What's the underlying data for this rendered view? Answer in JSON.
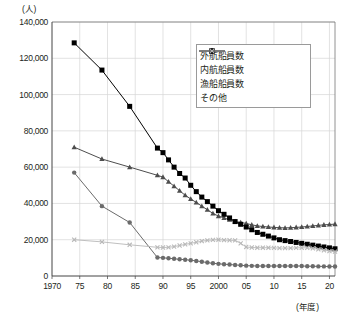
{
  "chart_data": {
    "type": "line",
    "title": "",
    "xlabel": "(年度)",
    "ylabel": "(人)",
    "ylim": [
      0,
      140000
    ],
    "ytick_step": 20000,
    "grid": true,
    "legend_position": "top-right",
    "ytick_labels": [
      "140,000",
      "120,000",
      "100,000",
      "80,000",
      "60,000",
      "40,000",
      "20,000",
      "0"
    ],
    "ytick_values": [
      140000,
      120000,
      100000,
      80000,
      60000,
      40000,
      20000,
      0
    ],
    "xtick_labels": [
      "1970",
      "75",
      "80",
      "85",
      "90",
      "95",
      "2000",
      "05",
      "10",
      "15",
      "20"
    ],
    "xtick_values": [
      1970,
      1975,
      1980,
      1985,
      1990,
      1995,
      2000,
      2005,
      2010,
      2015,
      2020
    ],
    "xlim": [
      1970,
      2021
    ],
    "series": [
      {
        "name": "外航船員数",
        "marker": "circle",
        "color": "#6b6b6b",
        "x": [
          1974,
          1979,
          1984,
          1989,
          1990,
          1991,
          1992,
          1993,
          1994,
          1995,
          1996,
          1997,
          1998,
          1999,
          2000,
          2001,
          2002,
          2003,
          2004,
          2005,
          2006,
          2007,
          2008,
          2009,
          2010,
          2011,
          2012,
          2013,
          2014,
          2015,
          2016,
          2017,
          2018,
          2019,
          2020,
          2021
        ],
        "values": [
          57000,
          38500,
          29500,
          10200,
          10000,
          9800,
          9500,
          9200,
          9000,
          8700,
          8300,
          7900,
          7400,
          7000,
          6700,
          6500,
          6300,
          6100,
          5900,
          5700,
          5600,
          5500,
          5500,
          5500,
          5500,
          5500,
          5500,
          5500,
          5500,
          5500,
          5400,
          5400,
          5300,
          5300,
          5200,
          5200
        ]
      },
      {
        "name": "内航船員数",
        "marker": "triangle",
        "color": "#4d4d4d",
        "x": [
          1974,
          1979,
          1984,
          1989,
          1990,
          1991,
          1992,
          1993,
          1994,
          1995,
          1996,
          1997,
          1998,
          1999,
          2000,
          2001,
          2002,
          2003,
          2004,
          2005,
          2006,
          2007,
          2008,
          2009,
          2010,
          2011,
          2012,
          2013,
          2014,
          2015,
          2016,
          2017,
          2018,
          2019,
          2020,
          2021
        ],
        "values": [
          71000,
          64500,
          60000,
          55500,
          54500,
          52000,
          49500,
          47000,
          44500,
          42500,
          40500,
          38500,
          36500,
          34500,
          33000,
          32000,
          31000,
          30000,
          29500,
          29000,
          28200,
          27600,
          27300,
          27000,
          26800,
          26600,
          26500,
          26600,
          26800,
          27000,
          27300,
          27600,
          27900,
          28200,
          28400,
          28600
        ]
      },
      {
        "name": "漁船船員数",
        "marker": "square",
        "color": "#000000",
        "x": [
          1974,
          1979,
          1984,
          1989,
          1990,
          1991,
          1992,
          1993,
          1994,
          1995,
          1996,
          1997,
          1998,
          1999,
          2000,
          2001,
          2002,
          2003,
          2004,
          2005,
          2006,
          2007,
          2008,
          2009,
          2010,
          2011,
          2012,
          2013,
          2014,
          2015,
          2016,
          2017,
          2018,
          2019,
          2020,
          2021
        ],
        "values": [
          128500,
          113500,
          93500,
          70500,
          68000,
          64000,
          60000,
          56500,
          54000,
          50000,
          46500,
          43500,
          41000,
          38500,
          36000,
          34000,
          32000,
          30000,
          28500,
          27000,
          25500,
          24000,
          23000,
          22000,
          21000,
          20000,
          19500,
          19000,
          18500,
          18000,
          17500,
          17000,
          16500,
          16000,
          15500,
          15000
        ]
      },
      {
        "name": "その他",
        "marker": "x",
        "color": "#b8b8b8",
        "x": [
          1974,
          1979,
          1984,
          1989,
          1990,
          1991,
          1992,
          1993,
          1994,
          1995,
          1996,
          1997,
          1998,
          1999,
          2000,
          2001,
          2002,
          2003,
          2004,
          2005,
          2006,
          2007,
          2008,
          2009,
          2010,
          2011,
          2012,
          2013,
          2014,
          2015,
          2016,
          2017,
          2018,
          2019,
          2020,
          2021
        ],
        "values": [
          20000,
          18800,
          17200,
          15800,
          15700,
          15800,
          16200,
          16800,
          17400,
          18000,
          18600,
          19200,
          19600,
          19900,
          20000,
          19800,
          19700,
          19600,
          18000,
          16000,
          15700,
          15600,
          15600,
          15600,
          15500,
          15400,
          15400,
          15400,
          15500,
          15600,
          15500,
          15200,
          14700,
          14200,
          13700,
          13400
        ]
      }
    ]
  }
}
